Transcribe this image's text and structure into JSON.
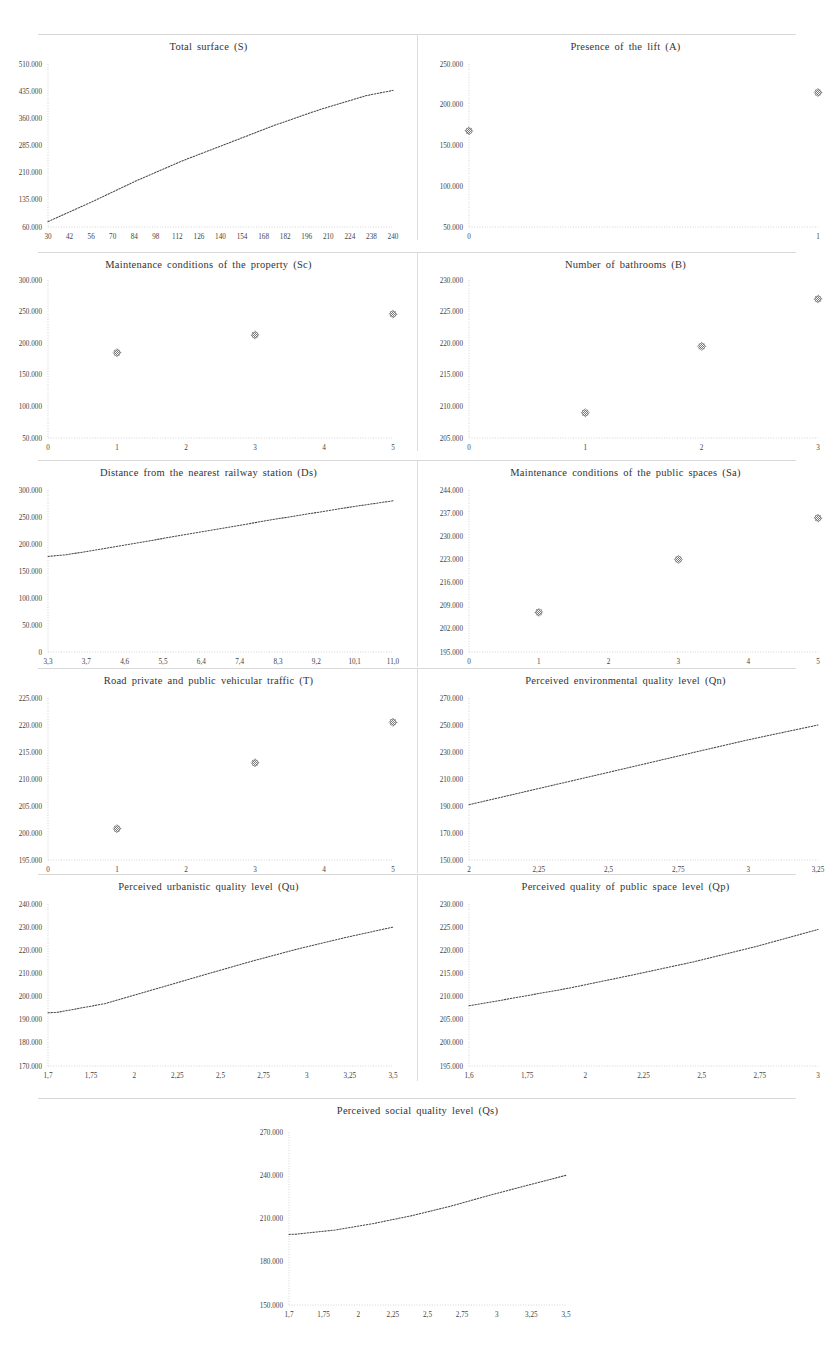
{
  "figure": {
    "panel_count": 9,
    "layout": "4 rows of 2 panels plus 1 centered panel"
  },
  "chart_data": [
    {
      "type": "line",
      "title": "Total surface (S)",
      "xlabel": "",
      "ylabel": "",
      "xticks": [
        "30",
        "42",
        "56",
        "70",
        "84",
        "98",
        "112",
        "126",
        "140",
        "154",
        "168",
        "182",
        "196",
        "210",
        "224",
        "238",
        "240"
      ],
      "yticks": [
        "60.000",
        "135.000",
        "210.000",
        "285.000",
        "360.000",
        "435.000",
        "510.000"
      ],
      "xlim": [
        30,
        240
      ],
      "ylim": [
        60000,
        510000
      ],
      "grid": false,
      "legend": "none",
      "x": [
        30,
        56,
        84,
        112,
        140,
        168,
        196,
        224,
        240
      ],
      "values": [
        75000,
        128000,
        188000,
        243000,
        292000,
        341000,
        385000,
        423000,
        437000
      ]
    },
    {
      "type": "scatter",
      "title": "Presence of the lift (A)",
      "xlabel": "",
      "ylabel": "",
      "xticks": [
        "0",
        "1"
      ],
      "yticks": [
        "50.000",
        "100.000",
        "150.000",
        "200.000",
        "250.000"
      ],
      "xlim": [
        0,
        1
      ],
      "ylim": [
        50000,
        250000
      ],
      "grid": false,
      "legend": "none",
      "x": [
        0,
        1
      ],
      "values": [
        168000,
        215000
      ]
    },
    {
      "type": "scatter",
      "title": "Maintenance  conditions  of the property (Sc)",
      "xlabel": "",
      "ylabel": "",
      "xticks": [
        "0",
        "1",
        "2",
        "3",
        "4",
        "5"
      ],
      "yticks": [
        "50.000",
        "100.000",
        "150.000",
        "200.000",
        "250.000",
        "300.000"
      ],
      "xlim": [
        0,
        5
      ],
      "ylim": [
        50000,
        300000
      ],
      "grid": false,
      "legend": "none",
      "x": [
        1,
        3,
        5
      ],
      "values": [
        185000,
        213000,
        246000
      ]
    },
    {
      "type": "scatter",
      "title": "Number of bathrooms (B)",
      "xlabel": "",
      "ylabel": "",
      "xticks": [
        "0",
        "1",
        "2",
        "3"
      ],
      "yticks": [
        "205.000",
        "210.000",
        "215.000",
        "220.000",
        "225.000",
        "230.000"
      ],
      "xlim": [
        0,
        3
      ],
      "ylim": [
        205000,
        230000
      ],
      "grid": false,
      "legend": "none",
      "x": [
        1,
        2,
        3
      ],
      "values": [
        209000,
        219500,
        227000
      ]
    },
    {
      "type": "line",
      "title": "Distance  from the nearest railway  station (Ds)",
      "xlabel": "",
      "ylabel": "",
      "xticks": [
        "3,3",
        "3,7",
        "4,6",
        "5,5",
        "6,4",
        "7,4",
        "8,3",
        "9,2",
        "10,1",
        "11,0"
      ],
      "yticks": [
        "0",
        "50.000",
        "100.000",
        "150.000",
        "200.000",
        "250.000",
        "300.000"
      ],
      "xlim": [
        3.3,
        11.0
      ],
      "ylim": [
        0,
        300000
      ],
      "grid": false,
      "legend": "none",
      "x": [
        3.3,
        3.7,
        4.6,
        5.5,
        6.4,
        7.4,
        8.3,
        9.2,
        10.1,
        11.0
      ],
      "values": [
        177000,
        180000,
        192000,
        205000,
        218000,
        232000,
        245000,
        257000,
        269000,
        280000
      ]
    },
    {
      "type": "scatter",
      "title": "Maintenance  conditions  of the public  spaces (Sa)",
      "xlabel": "",
      "ylabel": "",
      "xticks": [
        "0",
        "1",
        "2",
        "3",
        "4",
        "5"
      ],
      "yticks": [
        "195.000",
        "202.000",
        "209.000",
        "216.000",
        "223.000",
        "230.000",
        "237.000",
        "244.000"
      ],
      "xlim": [
        0,
        5
      ],
      "ylim": [
        195000,
        244000
      ],
      "grid": false,
      "legend": "none",
      "x": [
        1,
        3,
        5
      ],
      "values": [
        207000,
        223000,
        235500
      ]
    },
    {
      "type": "scatter",
      "title": "Road private  and public  vehicular  traffic  (T)",
      "xlabel": "",
      "ylabel": "",
      "xticks": [
        "0",
        "1",
        "2",
        "3",
        "4",
        "5"
      ],
      "yticks": [
        "195.000",
        "200.000",
        "205.000",
        "210.000",
        "215.000",
        "220.000",
        "225.000"
      ],
      "xlim": [
        0,
        5
      ],
      "ylim": [
        195000,
        225000
      ],
      "grid": false,
      "legend": "none",
      "x": [
        1,
        3,
        5
      ],
      "values": [
        200800,
        213000,
        220500
      ]
    },
    {
      "type": "line",
      "title": "Perceived environmental quality  level (Qn)",
      "xlabel": "",
      "ylabel": "",
      "xticks": [
        "2",
        "2,25",
        "2,5",
        "2,75",
        "3",
        "3,25"
      ],
      "yticks": [
        "150.000",
        "170.000",
        "190.000",
        "210.000",
        "230.000",
        "250.000",
        "270.000"
      ],
      "xlim": [
        2,
        3.25
      ],
      "ylim": [
        150000,
        270000
      ],
      "grid": false,
      "legend": "none",
      "x": [
        2,
        2.25,
        2.5,
        2.75,
        3,
        3.25
      ],
      "values": [
        191000,
        203000,
        215000,
        227000,
        239000,
        250000
      ]
    },
    {
      "type": "line",
      "title": "Perceived  urbanistic  quality  level (Qu)",
      "xlabel": "",
      "ylabel": "",
      "xticks": [
        "1,7",
        "1,75",
        "2",
        "2,25",
        "2,5",
        "2,75",
        "3",
        "3,25",
        "3,5"
      ],
      "yticks": [
        "170.000",
        "180.000",
        "190.000",
        "200.000",
        "210.000",
        "220.000",
        "230.000",
        "240.000"
      ],
      "xlim": [
        1.7,
        3.5
      ],
      "ylim": [
        170000,
        240000
      ],
      "grid": false,
      "legend": "none",
      "x": [
        1.7,
        1.75,
        2,
        2.25,
        2.5,
        2.75,
        3,
        3.25,
        3.5
      ],
      "values": [
        193000,
        193200,
        197000,
        203000,
        209000,
        215000,
        220500,
        225500,
        230000
      ]
    },
    {
      "type": "line",
      "title": "Perceived quality  of public  space level (Qp)",
      "xlabel": "",
      "ylabel": "",
      "xticks": [
        "1,6",
        "1,75",
        "2",
        "2,25",
        "2,5",
        "2,75",
        "3"
      ],
      "yticks": [
        "195.000",
        "200.000",
        "205.000",
        "210.000",
        "215.000",
        "220.000",
        "225.000",
        "230.000"
      ],
      "xlim": [
        1.6,
        3.0
      ],
      "ylim": [
        195000,
        230000
      ],
      "grid": false,
      "legend": "none",
      "x": [
        1.6,
        1.75,
        2,
        2.25,
        2.5,
        2.75,
        3
      ],
      "values": [
        208000,
        209400,
        211800,
        214600,
        217500,
        220800,
        224500
      ]
    },
    {
      "type": "line",
      "title": "Perceived social quality  level (Qs)",
      "xlabel": "",
      "ylabel": "",
      "xticks": [
        "1,7",
        "1,75",
        "2",
        "2,25",
        "2,5",
        "2,75",
        "3",
        "3,25",
        "3,5"
      ],
      "yticks": [
        "150.000",
        "180.000",
        "210.000",
        "240.000",
        "270.000"
      ],
      "xlim": [
        1.7,
        3.5
      ],
      "ylim": [
        150000,
        270000
      ],
      "grid": false,
      "legend": "none",
      "x": [
        1.7,
        1.75,
        2,
        2.25,
        2.5,
        2.75,
        3,
        3.25,
        3.5
      ],
      "values": [
        199000,
        199200,
        202000,
        206500,
        212000,
        218500,
        226000,
        233000,
        240000
      ]
    }
  ]
}
